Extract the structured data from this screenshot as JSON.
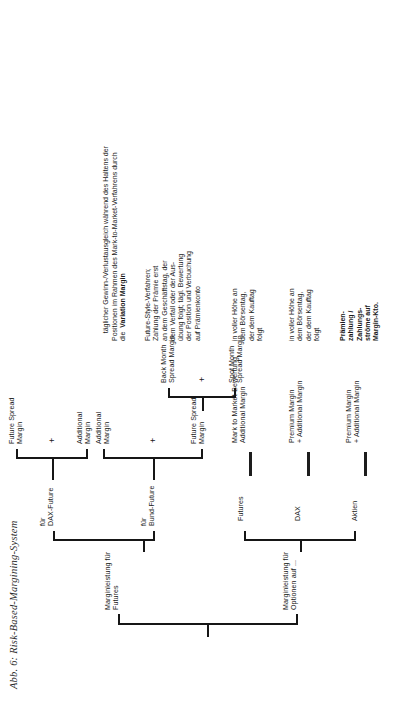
{
  "figure": {
    "caption": "Abb. 6: Risk-Based-Margining-System"
  },
  "tree": {
    "root_label": "",
    "options_branch": {
      "label": "Marginleistung für\nOptionen auf ...",
      "children": [
        {
          "label": "Aktien",
          "result": "Premium Margin\n+ Additional Margin"
        },
        {
          "label": "DAX",
          "result": "Premium Margin\n+ Additional Margin"
        }
      ]
    },
    "futures_branch": {
      "label": "Marginleistung für\nFutures",
      "children": [
        {
          "label": "für\nBund-Future",
          "terms": [
            "Future Spread\nMargin",
            "Additional\nMargin"
          ],
          "operator": "+",
          "sub": {
            "terms": [
              "Spot Month\nSpread Margin",
              "Back Month\nSpread Margin"
            ],
            "operator": "+"
          }
        },
        {
          "label": "für\nDAX-Future",
          "terms": [
            "Additional\nMargin",
            "Future Spread\nMargin"
          ],
          "operator": "+"
        }
      ]
    },
    "futures_result": "Mark to Market-Bewertung\nAdditional Margin"
  },
  "notes": {
    "row_label": "Prämien-\nzahlung /\nZahlungs-\nströme auf\nMargin-Kto.",
    "cells": [
      "in voller Höhe an\ndem Börsentag,\nder dem Kauftag\nfolgt",
      "in voller Höhe an\ndem Börsentag,\nder dem Kauftag\nfolgt",
      "Future-Style-Verfahren;\nZahlung der Prämie erst\nan dem Geschäftstag, der\ndem Verfall oder der Aus-\nübung folgt; tägl. Bewertung\nder Position und Verbuchung\nauf Prämienkonto",
      "täglicher Gewinn-/Verlustausgleich während des Haltens der\nPositionen im Rahmen des Mark-to-Market-Verfahrens durch\ndie  Variation Margin"
    ],
    "variation_margin_bold": "Variation Margin"
  },
  "operators": {
    "plus": "+"
  },
  "colors": {
    "ink": "#161616",
    "paper": "#ffffff"
  }
}
